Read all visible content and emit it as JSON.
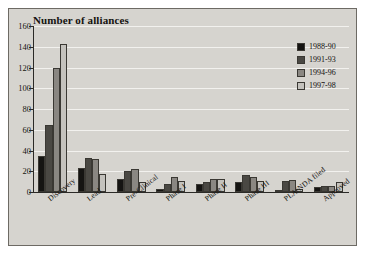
{
  "chart_data": {
    "type": "bar",
    "title": "Number of alliances",
    "xlabel": "",
    "ylabel": "",
    "ylim": [
      0,
      160
    ],
    "yticks": [
      0,
      20,
      40,
      60,
      80,
      100,
      120,
      140,
      160
    ],
    "grid": true,
    "legend_position": "top-right",
    "categories": [
      "Discovery",
      "Lead",
      "Pre-Clinical",
      "Phase I",
      "Phase II",
      "Phase III",
      "PLA/NDA filed",
      "Approved"
    ],
    "series": [
      {
        "name": "1988-90",
        "color": "#151412",
        "values": [
          35,
          23,
          13,
          3,
          8,
          10,
          2,
          5
        ]
      },
      {
        "name": "1991-93",
        "color": "#4a4843",
        "values": [
          65,
          33,
          20,
          8,
          10,
          16,
          11,
          6
        ]
      },
      {
        "name": "1994-96",
        "color": "#8a8782",
        "values": [
          120,
          32,
          22,
          14,
          13,
          14,
          12,
          6
        ]
      },
      {
        "name": "1997-98",
        "color": "#c4c2bd",
        "values": [
          143,
          17,
          10,
          11,
          13,
          11,
          3,
          10
        ]
      }
    ]
  },
  "colors": {
    "panel_background": "#d6d4cf",
    "panel_border": "#6d6a64",
    "gridline": "#f2f1ee",
    "axis": "#2b2a27",
    "text": "#14120f"
  }
}
